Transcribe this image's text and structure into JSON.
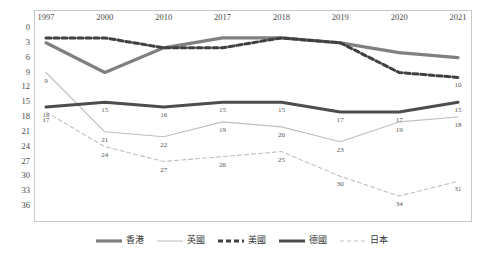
{
  "chart_data": {
    "type": "line",
    "title": "",
    "xlabel": "",
    "ylabel": "",
    "categories": [
      "1997",
      "2000",
      "2010",
      "2017",
      "2018",
      "2019",
      "2020",
      "2021"
    ],
    "ylim": [
      0,
      36
    ],
    "y_inverted": true,
    "yticks": [
      "0",
      "3",
      "6",
      "9",
      "12",
      "15",
      "18",
      "21",
      "24",
      "27",
      "30",
      "33",
      "36"
    ],
    "grid": false,
    "legend_position": "bottom-center",
    "series": [
      {
        "name": "香港",
        "color": "#808080",
        "style": "solid-thick",
        "values": [
          3,
          9,
          4,
          2,
          2,
          3,
          5,
          6
        ],
        "labels": [
          "",
          "",
          "",
          "",
          "",
          "",
          "",
          ""
        ]
      },
      {
        "name": "英國",
        "color": "#bfbfbf",
        "style": "solid-thin",
        "values": [
          9,
          21,
          22,
          19,
          20,
          23,
          19,
          18
        ],
        "labels": [
          "9",
          "21",
          "22",
          "19",
          "20",
          "23",
          "19",
          "18"
        ]
      },
      {
        "name": "美國",
        "color": "#404040",
        "style": "dashed-thick",
        "values": [
          2,
          2,
          4,
          4,
          2,
          3,
          9,
          10
        ],
        "labels": [
          "",
          "",
          "",
          "",
          "",
          "",
          "",
          "10"
        ]
      },
      {
        "name": "德國",
        "color": "#4d4d4d",
        "style": "solid-thick-dark",
        "values": [
          16,
          15,
          16,
          15,
          15,
          17,
          17,
          15
        ],
        "labels": [
          "16",
          "15",
          "16",
          "15",
          "15",
          "17",
          "17",
          "15"
        ]
      },
      {
        "name": "日本",
        "color": "#c0c0c0",
        "style": "dashed-thin",
        "values": [
          17,
          24,
          27,
          26,
          25,
          30,
          34,
          31
        ],
        "labels": [
          "17",
          "24",
          "27",
          "26",
          "25",
          "30",
          "34",
          "31"
        ]
      }
    ]
  },
  "legend": {
    "items": [
      {
        "label": "香港"
      },
      {
        "label": "英國"
      },
      {
        "label": "美國"
      },
      {
        "label": "德國"
      },
      {
        "label": "日本"
      }
    ]
  }
}
